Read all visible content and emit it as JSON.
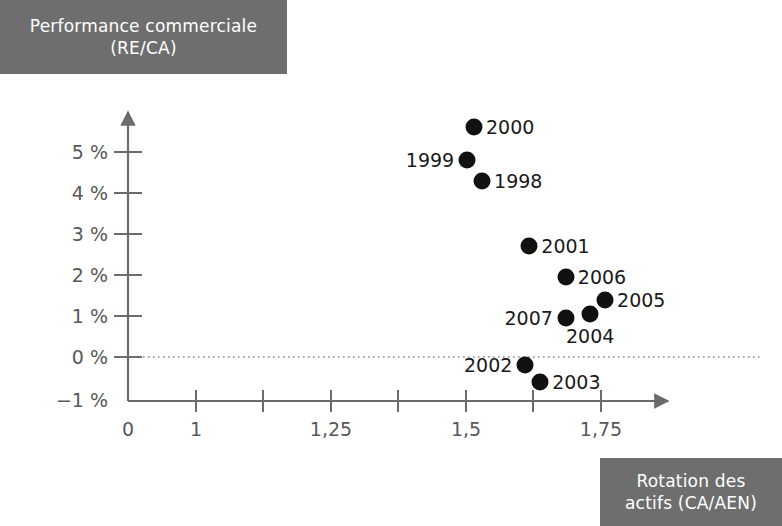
{
  "y_axis_title": {
    "line1": "Performance commerciale",
    "line2": "(RE/CA)"
  },
  "x_axis_title": {
    "line1": "Rotation des",
    "line2": "actifs (CA/AEN)"
  },
  "colors": {
    "title_box_background": "#6e6e6e",
    "title_box_text": "#ffffff",
    "axis_line": "#6b6b6d",
    "tick_label": "#58585a",
    "point_fill": "#111111",
    "zero_line": "#8a8a8a",
    "page_background": "#ffffff"
  },
  "chart_data": {
    "type": "scatter",
    "title": "Performance commerciale (RE/CA)",
    "xlabel": "Rotation des actifs (CA/AEN)",
    "ylabel": "Performance commerciale (RE/CA)",
    "xlim": [
      0,
      1.82
    ],
    "ylim": [
      -1,
      5.9
    ],
    "grid": false,
    "zero_line": true,
    "legend": "none",
    "x_tick_labels": [
      "0",
      "1",
      "",
      "1,25",
      "",
      "1,5",
      "",
      "1,75"
    ],
    "x_tick_values": [
      0,
      1,
      1.125,
      1.25,
      1.375,
      1.5,
      1.625,
      1.75
    ],
    "y_tick_labels": [
      "5 %",
      "4 %",
      "3 %",
      "2 %",
      "1 %",
      "0 %",
      "−1 %"
    ],
    "y_tick_values": [
      5,
      4,
      3,
      2,
      1,
      0,
      -1
    ],
    "points": [
      {
        "label": "2000",
        "x": 1.28,
        "y": 5.6,
        "label_pos": "right"
      },
      {
        "label": "1999",
        "x": 1.255,
        "y": 4.8,
        "label_pos": "left"
      },
      {
        "label": "1998",
        "x": 1.31,
        "y": 4.3,
        "label_pos": "right"
      },
      {
        "label": "2001",
        "x": 1.485,
        "y": 2.7,
        "label_pos": "right"
      },
      {
        "label": "2006",
        "x": 1.62,
        "y": 1.95,
        "label_pos": "right"
      },
      {
        "label": "2005",
        "x": 1.765,
        "y": 1.4,
        "label_pos": "right"
      },
      {
        "label": "2004",
        "x": 1.71,
        "y": 1.05,
        "label_pos": "below"
      },
      {
        "label": "2007",
        "x": 1.62,
        "y": 0.95,
        "label_pos": "left"
      },
      {
        "label": "2002",
        "x": 1.47,
        "y": -0.2,
        "label_pos": "left"
      },
      {
        "label": "2003",
        "x": 1.525,
        "y": -0.6,
        "label_pos": "right"
      }
    ]
  }
}
